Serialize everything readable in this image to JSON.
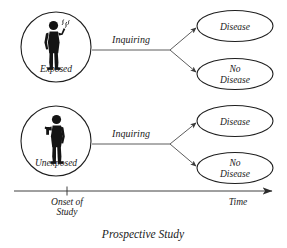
{
  "figure": {
    "caption": "Prospective Study",
    "colors": {
      "shaded_fill": "#e2e2e2",
      "plain_fill": "#ffffff",
      "outline": "#1f1f1f",
      "connector": "#4a4a4a",
      "text": "#1a1a1a",
      "figure_silhouette": "#141414"
    },
    "groups": [
      {
        "id": "exposed",
        "label": "Exposed",
        "shaded": true,
        "person_icon": "smoking-person-icon",
        "edge_label": "Inquiring",
        "outcomes": [
          {
            "id": "exposed-disease",
            "label": "Disease",
            "shaded": true
          },
          {
            "id": "exposed-no-disease",
            "label_line1": "No",
            "label_line2": "Disease",
            "shaded": false
          }
        ]
      },
      {
        "id": "unexposed",
        "label": "Unexposed",
        "shaded": false,
        "person_icon": "standing-person-icon",
        "edge_label": "Inquiring",
        "outcomes": [
          {
            "id": "unexposed-disease",
            "label": "Disease",
            "shaded": true
          },
          {
            "id": "unexposed-no-disease",
            "label_line1": "No",
            "label_line2": "Disease",
            "shaded": false
          }
        ]
      }
    ],
    "axis": {
      "tick_label_line1": "Onset of",
      "tick_label_line2": "Study",
      "end_label": "Time",
      "direction": "right"
    }
  }
}
